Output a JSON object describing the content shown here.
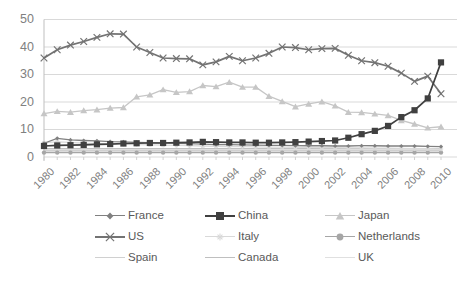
{
  "chart_data": {
    "type": "line",
    "title": "",
    "subtitle": "",
    "xlabel": "",
    "ylabel": "",
    "xlim": [
      1980,
      2010
    ],
    "ylim": [
      0,
      50
    ],
    "ytick_values": [
      0,
      10,
      20,
      30,
      40,
      50
    ],
    "ytick_labels": [
      "0",
      "10",
      "20",
      "30",
      "40",
      "50"
    ],
    "xtick_labels": [
      "1980",
      "1982",
      "1984",
      "1986",
      "1988",
      "1990",
      "1992",
      "1994",
      "1996",
      "1998",
      "2000",
      "2002",
      "2004",
      "2006",
      "2008",
      "2010"
    ],
    "x": [
      1980,
      1981,
      1982,
      1983,
      1984,
      1985,
      1986,
      1987,
      1988,
      1989,
      1990,
      1991,
      1992,
      1993,
      1994,
      1995,
      1996,
      1997,
      1998,
      1999,
      2000,
      2001,
      2002,
      2003,
      2004,
      2005,
      2006,
      2007,
      2008,
      2009,
      2010
    ],
    "grid": "horizontal",
    "legend_position": "bottom",
    "series": [
      {
        "name": "France",
        "marker": "diamond",
        "color": "#808080",
        "values": [
          5.0,
          6.8,
          6.2,
          6.0,
          5.9,
          5.6,
          5.5,
          5.3,
          5.2,
          5.1,
          5.0,
          4.9,
          4.7,
          4.5,
          4.5,
          4.4,
          4.3,
          4.2,
          4.2,
          4.1,
          4.1,
          4.1,
          4.0,
          4.0,
          4.1,
          4.1,
          4.0,
          4.0,
          4.0,
          3.9,
          3.8
        ]
      },
      {
        "name": "China",
        "marker": "square",
        "color": "#404040",
        "values": [
          4.0,
          4.2,
          4.3,
          4.4,
          4.6,
          4.7,
          4.9,
          5.0,
          5.1,
          5.1,
          5.2,
          5.3,
          5.5,
          5.4,
          5.3,
          5.3,
          5.2,
          5.2,
          5.3,
          5.4,
          5.6,
          5.8,
          6.0,
          7.0,
          8.3,
          9.5,
          11.3,
          14.5,
          17.0,
          21.3,
          34.4
        ]
      },
      {
        "name": "Japan",
        "marker": "triangle",
        "color": "#c6c6c6",
        "values": [
          15.8,
          16.6,
          16.3,
          16.9,
          17.2,
          17.8,
          18.0,
          21.9,
          22.6,
          24.5,
          23.5,
          23.8,
          26.0,
          25.6,
          27.2,
          25.4,
          25.4,
          22.1,
          20.2,
          18.3,
          19.3,
          20.1,
          18.6,
          16.3,
          16.2,
          15.7,
          15.1,
          13.3,
          12.0,
          10.6,
          11.0
        ]
      },
      {
        "name": "US",
        "marker": "x",
        "color": "#737373",
        "values": [
          36.0,
          39.0,
          40.7,
          42.0,
          43.5,
          44.8,
          44.7,
          40.0,
          38.0,
          36.0,
          35.8,
          35.7,
          33.5,
          34.6,
          36.6,
          35.0,
          36.0,
          37.7,
          40.0,
          39.8,
          39.0,
          39.4,
          39.5,
          37.0,
          35.0,
          34.3,
          33.0,
          30.5,
          27.5,
          29.4,
          23.0
        ]
      },
      {
        "name": "Italy",
        "marker": "star",
        "color": "#d9d9d9",
        "values": [
          5.2,
          5.5,
          5.3,
          5.0,
          4.9,
          4.7,
          4.6,
          4.5,
          4.4,
          4.3,
          4.2,
          4.1,
          4.0,
          3.9,
          3.8,
          3.8,
          3.7,
          3.6,
          3.6,
          3.5,
          3.5,
          3.4,
          3.4,
          3.3,
          3.3,
          3.2,
          3.2,
          3.1,
          3.0,
          3.0,
          2.9
        ]
      },
      {
        "name": "Netherlands",
        "marker": "circle",
        "color": "#a6a6a6",
        "values": [
          1.6,
          1.6,
          1.6,
          1.6,
          1.6,
          1.6,
          1.6,
          1.6,
          1.6,
          1.6,
          1.6,
          1.6,
          1.6,
          1.6,
          1.6,
          1.6,
          1.6,
          1.6,
          1.6,
          1.6,
          1.6,
          1.6,
          1.6,
          1.6,
          1.6,
          1.6,
          1.6,
          1.6,
          1.6,
          1.6,
          1.6
        ]
      },
      {
        "name": "Spain",
        "marker": "none",
        "color": "#d0d0d0",
        "values": [
          2.3,
          2.3,
          2.3,
          2.3,
          2.3,
          2.3,
          2.3,
          2.3,
          2.3,
          2.3,
          2.3,
          2.3,
          2.3,
          2.3,
          2.3,
          2.3,
          2.3,
          2.3,
          2.3,
          2.3,
          2.3,
          2.3,
          2.3,
          2.3,
          2.3,
          2.3,
          2.3,
          2.3,
          2.3,
          2.3,
          2.3
        ]
      },
      {
        "name": "Canada",
        "marker": "none",
        "color": "#bfbfbf",
        "values": [
          3.0,
          3.0,
          3.0,
          3.0,
          3.0,
          3.0,
          3.0,
          3.0,
          3.0,
          3.0,
          3.0,
          3.0,
          3.0,
          3.0,
          3.0,
          3.0,
          3.0,
          3.0,
          3.0,
          3.0,
          3.0,
          3.0,
          3.0,
          3.0,
          3.0,
          3.0,
          3.0,
          3.0,
          3.0,
          3.0,
          3.0
        ]
      },
      {
        "name": "UK",
        "marker": "none",
        "color": "#e0e0e0",
        "values": [
          2.0,
          2.0,
          2.0,
          2.0,
          2.0,
          2.0,
          2.0,
          2.0,
          2.0,
          2.0,
          2.0,
          2.0,
          2.0,
          2.0,
          2.0,
          2.0,
          2.0,
          2.0,
          2.0,
          2.0,
          2.0,
          2.0,
          2.0,
          2.0,
          2.0,
          2.0,
          2.0,
          2.0,
          2.0,
          2.0,
          2.0
        ]
      }
    ]
  },
  "legend": {
    "items": [
      {
        "label": "France",
        "marker": "diamond",
        "color": "#808080"
      },
      {
        "label": "China",
        "marker": "square",
        "color": "#404040"
      },
      {
        "label": "Japan",
        "marker": "triangle",
        "color": "#c6c6c6"
      },
      {
        "label": "US",
        "marker": "x",
        "color": "#737373"
      },
      {
        "label": "Italy",
        "marker": "star",
        "color": "#d9d9d9"
      },
      {
        "label": "Netherlands",
        "marker": "circle",
        "color": "#a6a6a6"
      },
      {
        "label": "Spain",
        "marker": "none",
        "color": "#d0d0d0"
      },
      {
        "label": "Canada",
        "marker": "none",
        "color": "#bfbfbf"
      },
      {
        "label": "UK",
        "marker": "none",
        "color": "#e0e0e0"
      }
    ]
  },
  "axes": {
    "y_ticks": [
      "50",
      "40",
      "30",
      "20",
      "10",
      "0"
    ],
    "x_ticks": [
      "1980",
      "1982",
      "1984",
      "1986",
      "1988",
      "1990",
      "1992",
      "1994",
      "1996",
      "1998",
      "2000",
      "2002",
      "2004",
      "2006",
      "2008",
      "2010"
    ]
  }
}
